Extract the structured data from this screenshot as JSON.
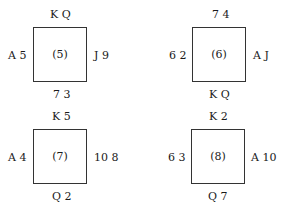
{
  "diagrams": [
    {
      "label": "(5)",
      "north": "K Q",
      "south": "7 3",
      "west": "A 5",
      "east": "J 9"
    },
    {
      "label": "(6)",
      "north": "7 4",
      "south": "K Q",
      "west": "6 2",
      "east": "A J"
    },
    {
      "label": "(7)",
      "north": "K 5",
      "south": "Q 2",
      "west": "A 4",
      "east": "10 8"
    },
    {
      "label": "(8)",
      "north": "K 2",
      "south": "Q 7",
      "west": "6 3",
      "east": "A 10"
    }
  ]
}
